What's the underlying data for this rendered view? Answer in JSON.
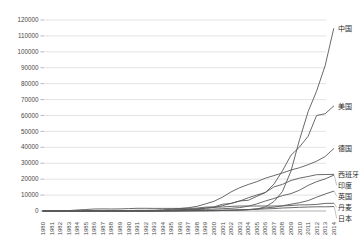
{
  "chart_data": {
    "type": "line",
    "title": "",
    "xlabel": "",
    "ylabel": "",
    "grid": "horizontal",
    "legend": "none",
    "series_label_position": "right-end-of-line",
    "x_tick_rotation": -90,
    "ylim": [
      0,
      120000
    ],
    "y_tick_step": 10000,
    "y_ticks": [
      0,
      10000,
      20000,
      30000,
      40000,
      50000,
      60000,
      70000,
      80000,
      90000,
      100000,
      110000,
      120000
    ],
    "x": [
      "1980",
      "1981",
      "1982",
      "1983",
      "1984",
      "1985",
      "1986",
      "1987",
      "1988",
      "1989",
      "1990",
      "1991",
      "1992",
      "1993",
      "1994",
      "1995",
      "1996",
      "1997",
      "1998",
      "1999",
      "2000",
      "2001",
      "2002",
      "2003",
      "2004",
      "2005",
      "2006",
      "2007",
      "2008",
      "2009",
      "2010",
      "2011",
      "2012",
      "2013",
      "2014"
    ],
    "series": [
      {
        "key": "china",
        "name": "中国",
        "values": [
          0,
          0,
          0,
          0,
          0,
          0,
          0,
          0,
          0,
          0,
          4,
          6,
          10,
          15,
          26,
          38,
          57,
          146,
          224,
          268,
          346,
          402,
          469,
          567,
          764,
          1260,
          2599,
          5912,
          12210,
          25104,
          44733,
          62364,
          75324,
          91412,
          114609
        ]
      },
      {
        "key": "usa",
        "name": "美国",
        "values": [
          8,
          18,
          84,
          254,
          653,
          945,
          1265,
          1333,
          1231,
          1332,
          1484,
          1709,
          1680,
          1635,
          1663,
          1612,
          1614,
          1611,
          1837,
          2445,
          2578,
          4275,
          4685,
          6372,
          6725,
          9149,
          11603,
          16819,
          25170,
          35086,
          40180,
          46919,
          60007,
          61110,
          65879
        ]
      },
      {
        "key": "germany",
        "name": "德国",
        "values": [
          0,
          0,
          0,
          0,
          0,
          0,
          0,
          0,
          0,
          20,
          55,
          100,
          174,
          326,
          618,
          1121,
          1549,
          2081,
          2874,
          4442,
          6095,
          8754,
          11994,
          14609,
          16629,
          18415,
          20622,
          22247,
          23903,
          25777,
          27191,
          29075,
          31270,
          34250,
          39165
        ]
      },
      {
        "key": "spain",
        "name": "西班牙",
        "values": [
          0,
          0,
          0,
          0,
          0,
          0,
          0,
          0,
          0,
          0,
          2,
          5,
          45,
          52,
          73,
          145,
          249,
          512,
          880,
          1812,
          2235,
          3337,
          4825,
          6203,
          8264,
          10028,
          11630,
          15131,
          16689,
          19149,
          20676,
          21674,
          22796,
          22959,
          22987
        ]
      },
      {
        "key": "india",
        "name": "印度",
        "values": [
          0,
          0,
          0,
          0,
          0,
          0,
          0,
          0,
          0,
          0,
          32,
          39,
          39,
          79,
          185,
          576,
          816,
          940,
          992,
          1035,
          1220,
          1456,
          1702,
          2110,
          3000,
          4430,
          6270,
          7845,
          9587,
          10925,
          13065,
          16084,
          18421,
          20150,
          22465
        ]
      },
      {
        "key": "uk",
        "name": "英国",
        "values": [
          0,
          0,
          0,
          0,
          0,
          0,
          0,
          0,
          0,
          5,
          10,
          12,
          32,
          130,
          170,
          200,
          270,
          319,
          333,
          344,
          406,
          474,
          552,
          648,
          888,
          1332,
          1963,
          2389,
          3288,
          4245,
          5203,
          6556,
          8649,
          10711,
          12440
        ]
      },
      {
        "key": "denmark",
        "name": "丹麦",
        "values": [
          5,
          10,
          20,
          35,
          50,
          65,
          85,
          110,
          200,
          250,
          343,
          410,
          458,
          487,
          539,
          637,
          835,
          1116,
          1420,
          1738,
          2390,
          2497,
          2880,
          3110,
          3118,
          3128,
          3136,
          3125,
          3180,
          3465,
          3802,
          3871,
          4162,
          4772,
          4845
        ]
      },
      {
        "key": "japan",
        "name": "日本",
        "values": [
          0,
          0,
          0,
          0,
          0,
          0,
          0,
          0,
          0,
          0,
          1,
          2,
          3,
          5,
          8,
          10,
          14,
          18,
          30,
          68,
          142,
          316,
          486,
          761,
          940,
          1040,
          1309,
          1528,
          1880,
          2056,
          2304,
          2501,
          2614,
          2669,
          2789
        ]
      }
    ],
    "colors": {
      "series_line": "#595959",
      "gridline": "#dcdcdc",
      "axis_line": "#a6a6a6",
      "tick_label": "#474747",
      "series_label": "#1f1f1f",
      "leader_line": "#9a9a9a",
      "background": "#ffffff"
    }
  }
}
